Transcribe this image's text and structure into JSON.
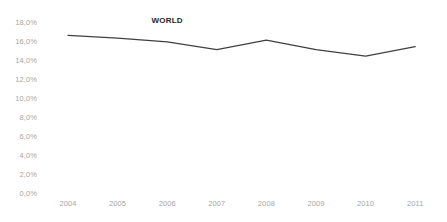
{
  "chart_data": {
    "type": "line",
    "title": "",
    "subtitle": "",
    "xlabel": "",
    "ylabel": "",
    "categories": [
      "2004",
      "2005",
      "2006",
      "2007",
      "2008",
      "2009",
      "2010",
      "2011"
    ],
    "series": [
      {
        "name": "WORLD",
        "values": [
          16.6,
          16.3,
          15.9,
          15.1,
          16.1,
          15.1,
          14.4,
          15.4
        ],
        "color": "#404040"
      }
    ],
    "ylim": [
      0,
      18
    ],
    "ytick_values": [
      0,
      2,
      4,
      6,
      8,
      10,
      12,
      14,
      16,
      18
    ],
    "ytick_labels": [
      "0,0%",
      "2,0%",
      "4,0%",
      "6,0%",
      "8,0%",
      "10,0%",
      "12,0%",
      "14,0%",
      "16,0%",
      "18,0%"
    ],
    "grid": false,
    "legend": "none",
    "annotations": [
      {
        "text": "WORLD",
        "x_category": "2006",
        "value": 18.0
      }
    ],
    "axis_label_color": "#a6a6a6",
    "background_color": "#ffffff"
  }
}
